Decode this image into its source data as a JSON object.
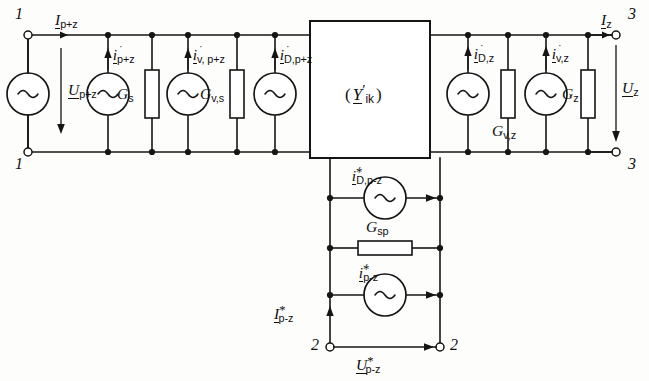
{
  "diagram": {
    "type": "electrical-equivalent-circuit",
    "background_color": "#fdfdfb",
    "line_color": "#151515",
    "center_block": {
      "label_open_paren": "(",
      "label_symbol": "Y",
      "label_prime": "′",
      "label_sub": "ik",
      "label_close_paren": ")",
      "label_full": "( Y′ik )"
    },
    "terminals": {
      "top_left": "1",
      "bottom_left": "1",
      "top_right": "3",
      "bottom_right": "3",
      "bottom_branch_left": "2",
      "bottom_branch_right": "2"
    },
    "left_port": {
      "current_label_sym": "I",
      "current_label_sub": "p+z",
      "voltage_label_sym": "U",
      "voltage_label_sub": "p+z"
    },
    "right_port": {
      "current_label_sym": "I",
      "current_label_sub": "z",
      "voltage_label_sym": "U",
      "voltage_label_sub": "z"
    },
    "bottom_port": {
      "current_label_sym": "I",
      "current_label_sub": "p-z",
      "current_label_star": "*",
      "voltage_label_sym": "U",
      "voltage_label_sub": "p-z",
      "voltage_label_star": "*"
    },
    "left_branches": [
      {
        "kind": "source",
        "sym": "i",
        "sub": "p+z",
        "dot": true,
        "star": false
      },
      {
        "kind": "resistor",
        "sym": "G",
        "sub": "s"
      },
      {
        "kind": "source",
        "sym": "i",
        "sub": "v, p+z",
        "dot": true,
        "star": false
      },
      {
        "kind": "resistor",
        "sym": "G",
        "sub": "v,s"
      },
      {
        "kind": "source",
        "sym": "i",
        "sub": "D,p+z",
        "dot": true,
        "star": false
      }
    ],
    "right_branches": [
      {
        "kind": "source",
        "sym": "i",
        "sub": "D,z",
        "dot": true,
        "star": false
      },
      {
        "kind": "resistor",
        "sym": "G",
        "sub": "v,z"
      },
      {
        "kind": "source",
        "sym": "i",
        "sub": "v,z",
        "dot": true,
        "star": false
      },
      {
        "kind": "resistor",
        "sym": "G",
        "sub": "z"
      }
    ],
    "bottom_branches": [
      {
        "kind": "source",
        "sym": "i",
        "sub": "D,p-z",
        "dot": true,
        "star": true
      },
      {
        "kind": "resistor",
        "sym": "G",
        "sub": "sp"
      },
      {
        "kind": "source",
        "sym": "i",
        "sub": "p-z",
        "dot": true,
        "star": true
      }
    ],
    "source_glyph": "~",
    "icon_names": [
      "ac-source-icon",
      "resistor-icon",
      "terminal-icon",
      "arrow-icon",
      "node-dot-icon"
    ]
  }
}
